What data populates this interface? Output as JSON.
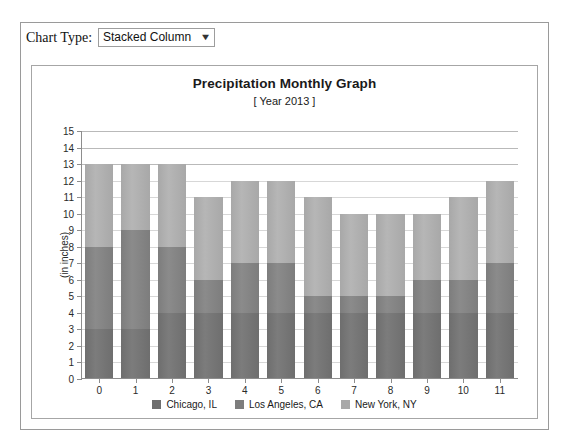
{
  "top_sliver_text": "·  ·        ·  ·                       ·  ·    ·",
  "toolbar": {
    "label": "Chart Type:",
    "selected_option": "Stacked Column",
    "caret_icon": "▼",
    "options": [
      "Stacked Column"
    ]
  },
  "chart_data": {
    "type": "bar",
    "stacked": true,
    "title": "Precipitation Monthly Graph",
    "subtitle": "[ Year 2013 ]",
    "xlabel": "",
    "ylabel": "(in inches)",
    "categories": [
      "0",
      "1",
      "2",
      "3",
      "4",
      "5",
      "6",
      "7",
      "8",
      "9",
      "10",
      "11"
    ],
    "ylim": [
      0,
      15
    ],
    "ytick_step": 1,
    "yticks": [
      "0",
      "1",
      "2",
      "3",
      "4",
      "5",
      "6",
      "7",
      "8",
      "9",
      "10",
      "11",
      "12",
      "13",
      "14",
      "15"
    ],
    "grid": true,
    "legend_position": "bottom",
    "series": [
      {
        "name": "Chicago, IL",
        "color": "#6e6e6e",
        "values": [
          3,
          3,
          4,
          4,
          4,
          4,
          4,
          4,
          4,
          4,
          4,
          4
        ]
      },
      {
        "name": "Los Angeles, CA",
        "color": "#7d7d7d",
        "values": [
          5,
          6,
          4,
          2,
          3,
          3,
          1,
          1,
          1,
          2,
          2,
          3
        ]
      },
      {
        "name": "New York, NY",
        "color": "#a8a8a8",
        "values": [
          5,
          4,
          5,
          5,
          5,
          5,
          6,
          5,
          5,
          4,
          5,
          5
        ]
      }
    ],
    "stack_totals": [
      13,
      13,
      13,
      11,
      12,
      12,
      11,
      10,
      10,
      10,
      11,
      12
    ]
  },
  "colors": {
    "panel_border": "#9a9a9a",
    "chart_border": "#a6a6a6",
    "gridline": "#b9b9b9",
    "axis": "#8d8d8d",
    "background": "#ffffff"
  }
}
